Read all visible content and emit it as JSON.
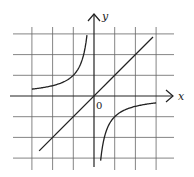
{
  "figure": {
    "origin_px": [
      94,
      96
    ],
    "unit_px": 20.7,
    "grid": {
      "x_min": -3,
      "x_max": 3,
      "y_min": -3,
      "y_max": 3,
      "color": "#666666"
    },
    "axes": {
      "x_label": "x",
      "y_label": "y",
      "origin_label": "0",
      "color": "#222222"
    },
    "curves": [
      {
        "name": "hyperbola",
        "equation": "y = -1/x",
        "branches": [
          {
            "x_from": -3.0,
            "x_to": -0.34
          },
          {
            "x_from": 0.32,
            "x_to": 3.0
          }
        ]
      },
      {
        "name": "line",
        "equation": "y = x",
        "x_from": -2.65,
        "x_to": 2.85
      }
    ]
  }
}
